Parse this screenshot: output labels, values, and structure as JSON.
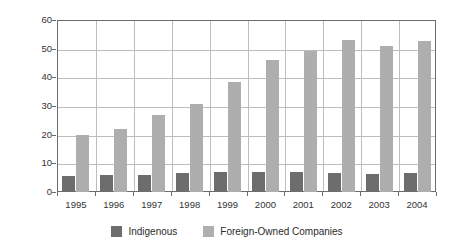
{
  "chart_data": {
    "type": "bar",
    "title": "",
    "xlabel": "",
    "ylabel": "€ Billions",
    "ylim": [
      0,
      60
    ],
    "yticks": [
      0,
      10,
      20,
      30,
      40,
      50,
      60
    ],
    "ytick_labels": [
      "0",
      "10",
      "20",
      "30",
      "40",
      "50",
      "60"
    ],
    "grid": true,
    "legend_position": "bottom",
    "categories": [
      "1995",
      "1996",
      "1997",
      "1998",
      "1999",
      "2000",
      "2001",
      "2002",
      "2003",
      "2004"
    ],
    "series": [
      {
        "name": "Indigenous",
        "color": "#6d6d6d",
        "values": [
          5.5,
          5.8,
          6.1,
          6.7,
          7.1,
          7.0,
          6.9,
          6.8,
          6.3,
          6.6
        ]
      },
      {
        "name": "Foreign-Owned Companies",
        "color": "#aeaeae",
        "values": [
          19.8,
          22.0,
          26.7,
          30.6,
          38.5,
          46.0,
          49.3,
          53.1,
          51.1,
          52.8
        ]
      }
    ]
  },
  "legend": {
    "items": [
      {
        "label": "Indigenous",
        "swatch": "indigenous"
      },
      {
        "label": "Foreign-Owned Companies",
        "swatch": "foreign"
      }
    ]
  },
  "colors": {
    "indigenous": "#6d6d6d",
    "foreign": "#aeaeae",
    "axis": "#6b6b6b",
    "grid": "#bdbdbd",
    "text": "#333333",
    "background": "#ffffff"
  }
}
